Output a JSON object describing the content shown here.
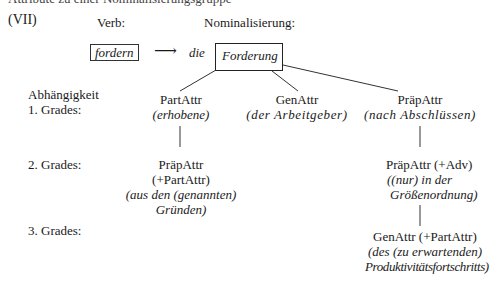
{
  "header": {
    "cut_line": "Attribute zu einer Nominalisierungsgruppe"
  },
  "example": {
    "number": "(VII)",
    "verb_label": "Verb:",
    "nominal_label": "Nominalisierung:",
    "verb": "fordern",
    "arrow": "⟶",
    "article": "die",
    "noun": "Forderung"
  },
  "levels": {
    "abh": "Abhängigkeit",
    "first": "1. Grades:",
    "second": "2. Grades:",
    "third": "3. Grades:"
  },
  "tree": {
    "level1": [
      {
        "type": "PartAttr",
        "lines": [
          "(erhobene)"
        ]
      },
      {
        "type": "GenAttr",
        "lines": [
          "(der Arbeitgeber)"
        ]
      },
      {
        "type": "PräpAttr",
        "lines": [
          "(nach Abschlüssen)"
        ]
      }
    ],
    "level2": [
      {
        "type": "PräpAttr",
        "extra": "(+PartAttr)",
        "lines": [
          "(aus den (genannten)",
          "Gründen)"
        ]
      },
      {
        "type": "PräpAttr (+Adv)",
        "lines": [
          "((nur) in der",
          "Größenordnung)"
        ]
      }
    ],
    "level3": [
      {
        "type": "GenAttr (+PartAttr)",
        "lines": [
          "(des (zu erwartenden)",
          "Produktivitätsfortschritts)"
        ]
      }
    ]
  }
}
